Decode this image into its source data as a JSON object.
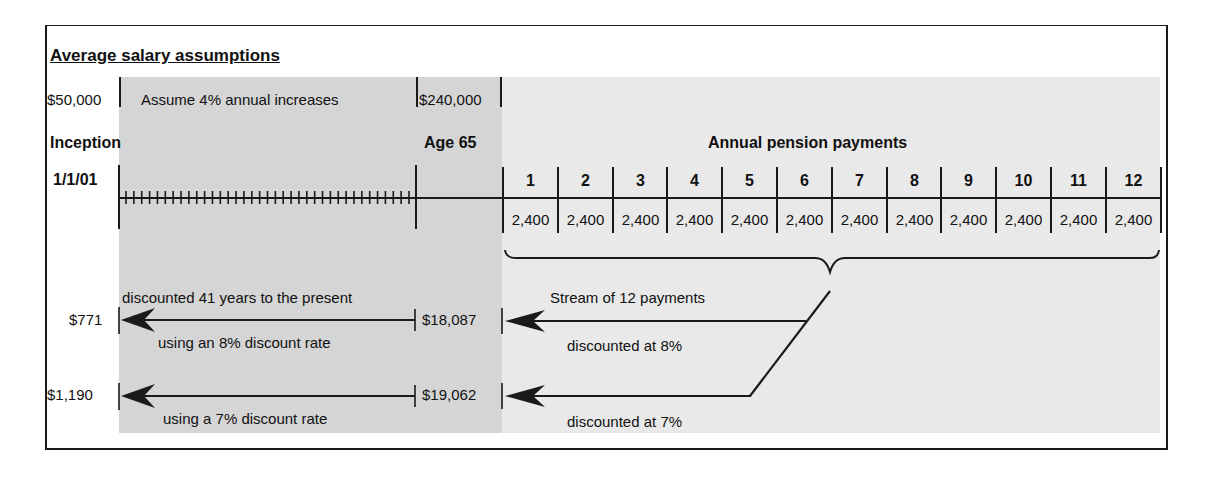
{
  "title": "Average salary assumptions",
  "salary": {
    "start": "$50,000",
    "growth_note": "Assume 4% annual increases",
    "end": "$240,000"
  },
  "timeline": {
    "start_label": "Inception",
    "start_date": "1/1/01",
    "retirement_label": "Age 65",
    "payments_label": "Annual pension payments"
  },
  "payments": [
    {
      "year": "1",
      "amount": "2,400"
    },
    {
      "year": "2",
      "amount": "2,400"
    },
    {
      "year": "3",
      "amount": "2,400"
    },
    {
      "year": "4",
      "amount": "2,400"
    },
    {
      "year": "5",
      "amount": "2,400"
    },
    {
      "year": "6",
      "amount": "2,400"
    },
    {
      "year": "7",
      "amount": "2,400"
    },
    {
      "year": "8",
      "amount": "2,400"
    },
    {
      "year": "9",
      "amount": "2,400"
    },
    {
      "year": "10",
      "amount": "2,400"
    },
    {
      "year": "11",
      "amount": "2,400"
    },
    {
      "year": "12",
      "amount": "2,400"
    }
  ],
  "stream": {
    "label": "Stream of 12 payments",
    "rate8_label": "discounted at 8%",
    "rate7_label": "discounted at 7%"
  },
  "discounting": {
    "top_note": "discounted 41 years to the present",
    "rate8": {
      "present_value": "$771",
      "value_at_65": "$18,087",
      "note": "using an 8% discount rate"
    },
    "rate7": {
      "present_value": "$1,190",
      "value_at_65": "$19,062",
      "note": "using a 7% discount rate"
    }
  },
  "colors": {
    "accumulation_shade": "#d5d5d5",
    "payout_shade": "#e9e9e9",
    "ink": "#1a1a1a"
  }
}
